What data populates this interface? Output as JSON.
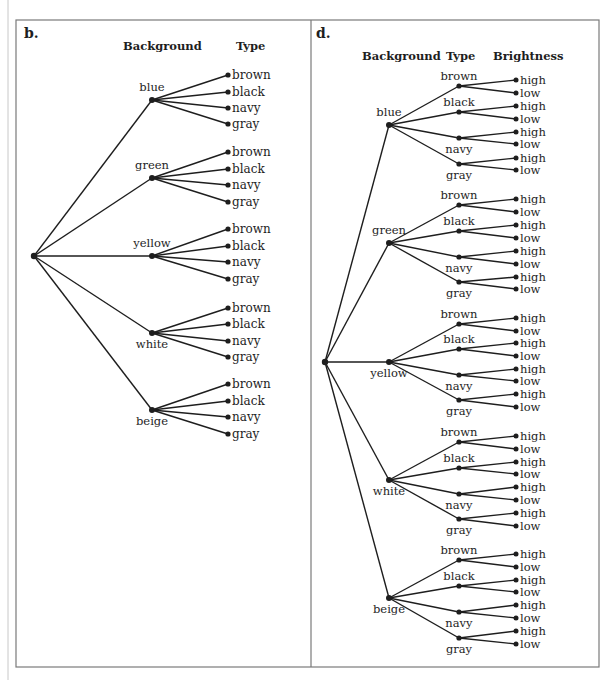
{
  "figure": {
    "panels": [
      {
        "id": "b",
        "label": "b.",
        "headers": [
          "Background",
          "Type"
        ],
        "tree": {
          "backgrounds": [
            {
              "label": "blue",
              "types": [
                "brown",
                "black",
                "navy",
                "gray"
              ]
            },
            {
              "label": "green",
              "types": [
                "brown",
                "black",
                "navy",
                "gray"
              ]
            },
            {
              "label": "yellow",
              "types": [
                "brown",
                "black",
                "navy",
                "gray"
              ]
            },
            {
              "label": "white",
              "types": [
                "brown",
                "black",
                "navy",
                "gray"
              ]
            },
            {
              "label": "beige",
              "types": [
                "brown",
                "black",
                "navy",
                "gray"
              ]
            }
          ]
        }
      },
      {
        "id": "d",
        "label": "d.",
        "headers": [
          "Background",
          "Type",
          "Brightness"
        ],
        "tree": {
          "backgrounds": [
            {
              "label": "blue",
              "types": [
                {
                  "label": "brown",
                  "brightness": [
                    "high",
                    "low"
                  ]
                },
                {
                  "label": "black",
                  "brightness": [
                    "high",
                    "low"
                  ]
                },
                {
                  "label": "navy",
                  "brightness": [
                    "high",
                    "low"
                  ]
                },
                {
                  "label": "gray",
                  "brightness": [
                    "high",
                    "low"
                  ]
                }
              ]
            },
            {
              "label": "green",
              "types": [
                {
                  "label": "brown",
                  "brightness": [
                    "high",
                    "low"
                  ]
                },
                {
                  "label": "black",
                  "brightness": [
                    "high",
                    "low"
                  ]
                },
                {
                  "label": "navy",
                  "brightness": [
                    "high",
                    "low"
                  ]
                },
                {
                  "label": "gray",
                  "brightness": [
                    "high",
                    "low"
                  ]
                }
              ]
            },
            {
              "label": "yellow",
              "types": [
                {
                  "label": "brown",
                  "brightness": [
                    "high",
                    "low"
                  ]
                },
                {
                  "label": "black",
                  "brightness": [
                    "high",
                    "low"
                  ]
                },
                {
                  "label": "navy",
                  "brightness": [
                    "high",
                    "low"
                  ]
                },
                {
                  "label": "gray",
                  "brightness": [
                    "high",
                    "low"
                  ]
                }
              ]
            },
            {
              "label": "white",
              "types": [
                {
                  "label": "brown",
                  "brightness": [
                    "high",
                    "low"
                  ]
                },
                {
                  "label": "black",
                  "brightness": [
                    "high",
                    "low"
                  ]
                },
                {
                  "label": "navy",
                  "brightness": [
                    "high",
                    "low"
                  ]
                },
                {
                  "label": "gray",
                  "brightness": [
                    "high",
                    "low"
                  ]
                }
              ]
            },
            {
              "label": "beige",
              "types": [
                {
                  "label": "brown",
                  "brightness": [
                    "high",
                    "low"
                  ]
                },
                {
                  "label": "black",
                  "brightness": [
                    "high",
                    "low"
                  ]
                },
                {
                  "label": "navy",
                  "brightness": [
                    "high",
                    "low"
                  ]
                },
                {
                  "label": "gray",
                  "brightness": [
                    "high",
                    "low"
                  ]
                }
              ]
            }
          ]
        }
      }
    ],
    "colors": {
      "ink": "#1e1e1e",
      "border": "#7a7a7a",
      "background": "#ffffff"
    }
  }
}
